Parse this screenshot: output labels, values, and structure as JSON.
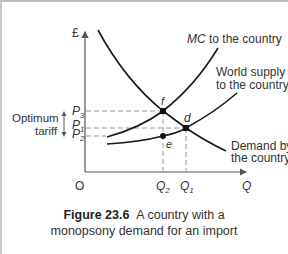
{
  "figure": {
    "number_label": "Figure 23.6",
    "caption_line1": "A country with a",
    "caption_line2": "monopsony demand for an import"
  },
  "axes": {
    "y_label": "£",
    "x_label": "Q",
    "origin_label": "O"
  },
  "price_labels": {
    "p3": "P",
    "p3_sub": "3",
    "p1": "P",
    "p1_sub": "1",
    "p2": "P",
    "p2_sub": "2"
  },
  "quantity_labels": {
    "q2": "Q",
    "q2_sub": "2",
    "q1": "Q",
    "q1_sub": "1"
  },
  "point_labels": {
    "f": "f",
    "d": "d",
    "e": "e"
  },
  "curve_labels": {
    "mc_italic": "MC",
    "mc_rest": " to the country",
    "supply_line1": "World supply",
    "supply_line2": "to the country",
    "demand_line1": "Demand by",
    "demand_line2": "the country"
  },
  "annotation": {
    "line1": "Optimum",
    "line2": "tariff"
  },
  "colors": {
    "curve": "#1a1a1a",
    "axis": "#555555",
    "dashed": "#9a9a9a",
    "text": "#333333"
  }
}
